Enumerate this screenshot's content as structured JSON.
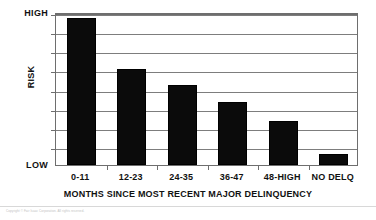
{
  "chart_data": {
    "type": "bar",
    "title": "",
    "categories": [
      "0-11",
      "12-23",
      "24-35",
      "36-47",
      "48-HIGH",
      "NO DELQ"
    ],
    "values": [
      7.7,
      5.0,
      4.2,
      3.3,
      2.3,
      0.6
    ],
    "xlabel": "MONTHS SINCE MOST RECENT MAJOR DELINQUENCY",
    "ylabel": "RISK",
    "ylim": [
      0,
      8
    ],
    "ytick_labels": [
      "LOW",
      "HIGH"
    ],
    "ytick_low": "LOW",
    "ytick_high": "HIGH",
    "gridlines": 8,
    "grid": true,
    "legend": "none",
    "bar_color": "#0b0b0b",
    "grid_color": "#7d7d7d",
    "axis_color": "#6e6e6e",
    "background_color": "#ffffff"
  },
  "footer": {
    "note": "Copyright © Fair Isaac Corporation. All rights reserved."
  }
}
